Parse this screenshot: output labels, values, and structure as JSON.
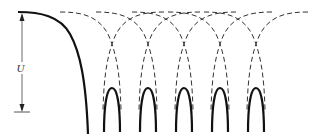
{
  "diagram": {
    "depth_label": "U",
    "barrier_count": 5,
    "colors": {
      "line": "#111111",
      "dashed": "#333333",
      "arrow": "#444444",
      "background": "#ffffff"
    }
  }
}
